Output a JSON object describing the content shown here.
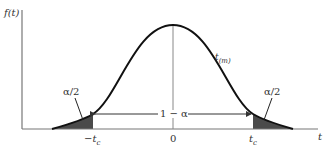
{
  "diagram": {
    "y_axis_label": "f(t)",
    "x_axis_label": "t",
    "curve_label": "t",
    "curve_label_sub": "(m)",
    "tick_labels": {
      "left": "−t",
      "left_sub": "c",
      "center": "0",
      "right": "t",
      "right_sub": "c"
    },
    "central_area_label": "1 − α",
    "left_tail_label": "α/2",
    "right_tail_label": "α/2",
    "colors": {
      "curve": "#111111",
      "axis": "#666666",
      "shade": "#4a4a4a"
    }
  }
}
